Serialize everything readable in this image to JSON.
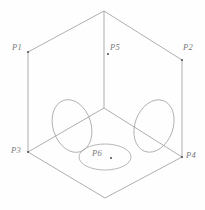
{
  "diagram": {
    "type": "line-drawing",
    "canvas": {
      "width": 205,
      "height": 210
    },
    "style": {
      "line_color": "#8d8d8d",
      "label_color": "#7a7a7a",
      "point_color": "#555555",
      "background": "#fefefe",
      "line_width": 0.7
    },
    "cube": {
      "description": "Hexagonal isometric outline of a cube with three internal edges meeting at the center",
      "vertices": {
        "top": {
          "x": 104,
          "y": 11
        },
        "left_upper": {
          "x": 28,
          "y": 52
        },
        "right_upper": {
          "x": 182,
          "y": 60
        },
        "left_lower": {
          "x": 28,
          "y": 152
        },
        "right_lower": {
          "x": 182,
          "y": 157
        },
        "bottom": {
          "x": 105,
          "y": 198
        },
        "center": {
          "x": 104,
          "y": 108
        }
      },
      "outline_path": "M104,11 L28,52 L28,152 L105,198 L182,157 L182,60 Z",
      "internal_edges": [
        {
          "from": "top",
          "to": "center"
        },
        {
          "from": "left_lower",
          "to": "center"
        },
        {
          "from": "right_lower",
          "to": "center"
        }
      ]
    },
    "ellipses": [
      {
        "name": "left-face-ellipse",
        "cx": 72,
        "cy": 126,
        "rx": 19,
        "ry": 27,
        "rotation_deg": -18
      },
      {
        "name": "right-face-ellipse",
        "cx": 154,
        "cy": 126,
        "rx": 19,
        "ry": 27,
        "rotation_deg": 20
      },
      {
        "name": "bottom-face-ellipse",
        "cx": 105,
        "cy": 157,
        "rx": 26,
        "ry": 13,
        "rotation_deg": 0
      }
    ],
    "labels": [
      {
        "name": "p1",
        "text": "P1",
        "x": 12,
        "y": 42,
        "point": {
          "x": 28,
          "y": 52
        }
      },
      {
        "name": "p2",
        "text": "P2",
        "x": 183,
        "y": 42,
        "point": {
          "x": 182,
          "y": 60
        }
      },
      {
        "name": "p3",
        "text": "P3",
        "x": 11,
        "y": 145,
        "point": {
          "x": 28,
          "y": 152
        }
      },
      {
        "name": "p4",
        "text": "P4",
        "x": 186,
        "y": 150,
        "point": {
          "x": 182,
          "y": 157
        }
      },
      {
        "name": "p5",
        "text": "P5",
        "x": 110,
        "y": 42,
        "point": {
          "x": 108,
          "y": 54
        }
      },
      {
        "name": "p6",
        "text": "P6",
        "x": 92,
        "y": 148,
        "point": {
          "x": 111,
          "y": 158
        }
      }
    ]
  }
}
